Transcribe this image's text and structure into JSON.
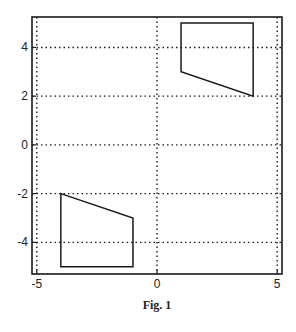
{
  "chart_data": {
    "type": "line",
    "title": "",
    "caption": "Fig. 1",
    "xlabel": "",
    "ylabel": "",
    "xlim": [
      -5.2,
      5.2
    ],
    "ylim": [
      -5.3,
      5.25
    ],
    "xticks": [
      -5,
      0,
      5
    ],
    "yticks": [
      -4,
      -2,
      0,
      2,
      4
    ],
    "grid": true,
    "grid_style": "dotted",
    "series": [
      {
        "name": "polygon-upper",
        "closed": true,
        "points": [
          [
            1,
            5
          ],
          [
            4,
            5
          ],
          [
            4,
            2
          ],
          [
            1,
            3
          ]
        ]
      },
      {
        "name": "polygon-lower",
        "closed": true,
        "points": [
          [
            -4,
            -2
          ],
          [
            -1,
            -3
          ],
          [
            -1,
            -5
          ],
          [
            -4,
            -5
          ]
        ]
      }
    ],
    "colors": {
      "line": "#1a1a1a",
      "grid": "#1a1a1a",
      "frame": "#1a1a1a"
    }
  }
}
